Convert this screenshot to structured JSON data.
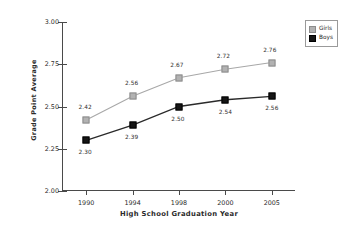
{
  "chart_data": {
    "type": "line",
    "title": "",
    "xlabel": "High School Graduation Year",
    "ylabel": "Grade Point Average",
    "categories": [
      "1990",
      "1994",
      "1998",
      "2000",
      "2005"
    ],
    "ylim": [
      2.0,
      3.0
    ],
    "ytick_labels": [
      "2.00",
      "2.25",
      "2.50",
      "2.75",
      "3.00"
    ],
    "ytick_values": [
      2.0,
      2.25,
      2.5,
      2.75,
      3.0
    ],
    "grid": false,
    "legend_position": "outside-top-right",
    "series": [
      {
        "name": "Girls",
        "color": "#b2b2b2",
        "values": [
          2.42,
          2.56,
          2.67,
          2.72,
          2.76
        ],
        "labels": [
          "2.42",
          "2.56",
          "2.67",
          "2.72",
          "2.76"
        ]
      },
      {
        "name": "Boys",
        "color": "#161616",
        "values": [
          2.3,
          2.39,
          2.5,
          2.54,
          2.56
        ],
        "labels": [
          "2.30",
          "2.39",
          "2.50",
          "2.54",
          "2.56"
        ]
      }
    ]
  },
  "legend": {
    "items": [
      {
        "label": "Girls",
        "swatch": "girls"
      },
      {
        "label": "Boys",
        "swatch": "boys"
      }
    ]
  }
}
